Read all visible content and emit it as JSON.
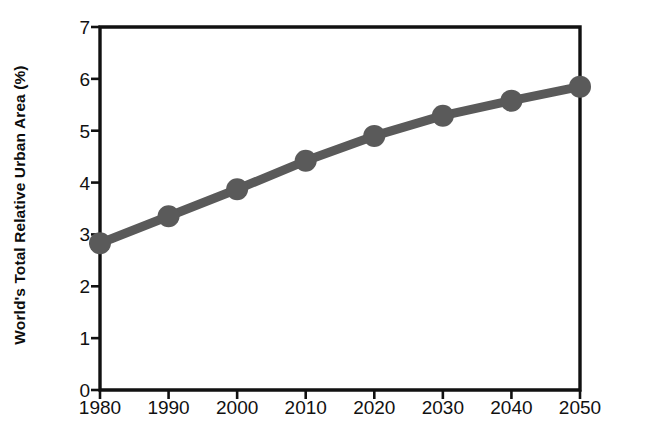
{
  "chart_data": {
    "type": "line",
    "title": "",
    "xlabel": "",
    "ylabel": "World's Total Relative Urban Area (%)",
    "categories": [
      "1980",
      "1990",
      "2000",
      "2010",
      "2020",
      "2030",
      "2040",
      "2050"
    ],
    "x": [
      1980,
      1990,
      2000,
      2010,
      2020,
      2030,
      2040,
      2050
    ],
    "values": [
      2.83,
      3.35,
      3.87,
      4.42,
      4.9,
      5.29,
      5.58,
      5.85
    ],
    "series": [
      {
        "name": "World's Total Relative Urban Area",
        "values": [
          2.83,
          3.35,
          3.87,
          4.42,
          4.9,
          5.29,
          5.58,
          5.85
        ]
      }
    ],
    "ylim": [
      0,
      7
    ],
    "xlim": [
      1980,
      2050
    ],
    "yticks": [
      0,
      1,
      2,
      3,
      4,
      5,
      6,
      7
    ],
    "ytick_labels": [
      "0",
      "1",
      "2",
      "3",
      "4",
      "5",
      "6",
      "7"
    ],
    "xticks": [
      1980,
      1990,
      2000,
      2010,
      2020,
      2030,
      2040,
      2050
    ],
    "xtick_labels": [
      "1980",
      "1990",
      "2000",
      "2010",
      "2020",
      "2030",
      "2040",
      "2050"
    ],
    "grid": false,
    "legend": null,
    "legend_position": "none",
    "marker": "circle",
    "annotations": []
  },
  "style": {
    "series_color": "#5a5a5a",
    "axis_color": "#111111",
    "text_color": "#111111",
    "background": "#ffffff",
    "line_width_px": 9,
    "marker_radius_px": 11
  },
  "axis_titles": {
    "y": "World's Total Relative Urban Area (%)",
    "x": ""
  }
}
